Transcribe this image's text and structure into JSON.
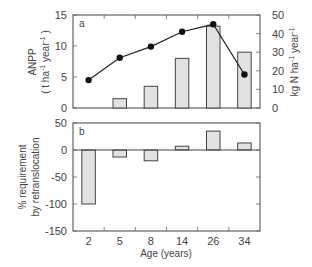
{
  "chart_data": [
    {
      "panel": "a",
      "type": "bar+line",
      "categories": [
        "2",
        "5",
        "8",
        "14",
        "26",
        "34"
      ],
      "series": [
        {
          "name": "ANPP",
          "type": "bar",
          "axis": "left",
          "values": [
            0,
            1.5,
            3.5,
            8,
            13.2,
            9
          ]
        },
        {
          "name": "N requirement",
          "type": "line",
          "axis": "right",
          "values": [
            15,
            27,
            33,
            41,
            45,
            18
          ]
        }
      ],
      "ylabel_left": "ANPP",
      "ylabel_left_units": "( t ha-1 year-1 )",
      "ylabel_right": "kg N ha-1 year-1",
      "ylim_left": [
        0,
        15
      ],
      "yticks_left": [
        0,
        5,
        10,
        15
      ],
      "ylim_right": [
        0,
        50
      ],
      "yticks_right": [
        0,
        10,
        20,
        30,
        40,
        50
      ],
      "panel_label": "a"
    },
    {
      "panel": "b",
      "type": "bar",
      "categories": [
        "2",
        "5",
        "8",
        "14",
        "26",
        "34"
      ],
      "values": [
        -100,
        -13,
        -20,
        7,
        35,
        13
      ],
      "ylabel": "% requirement by retranslocation",
      "xlabel": "Age (years)",
      "ylim": [
        -150,
        50
      ],
      "yticks": [
        -150,
        -100,
        -50,
        0,
        50
      ],
      "panel_label": "b"
    }
  ],
  "labels": {
    "panel_a": "a",
    "panel_b": "b",
    "anpp": "ANPP",
    "anpp_units_open": "( t ha",
    "anpp_units_sup1": "-1",
    "anpp_units_mid": " year",
    "anpp_units_sup2": "-1",
    "anpp_units_close": " )",
    "right_units_main": "kg N ha",
    "right_units_sup1": "-1",
    "right_units_mid": " year",
    "right_units_sup2": "-1",
    "b_ylabel_line1": "% requirement",
    "b_ylabel_line2": "by retranslocation",
    "xlabel": "Age (years)"
  },
  "ticks": {
    "left_a": [
      "0",
      "5",
      "10",
      "15"
    ],
    "right_a": [
      "0",
      "10",
      "20",
      "30",
      "40",
      "50"
    ],
    "left_b": [
      "-150",
      "-100",
      "-50",
      "0",
      "50"
    ],
    "x": [
      "2",
      "5",
      "8",
      "14",
      "26",
      "34"
    ]
  }
}
